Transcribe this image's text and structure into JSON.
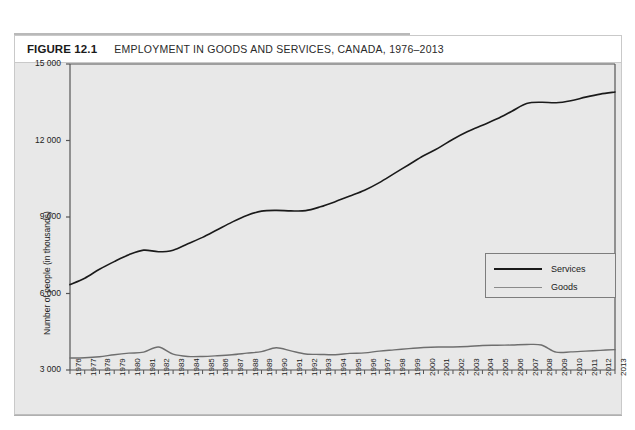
{
  "figure": {
    "number_label": "FIGURE 12.1",
    "title": "EMPLOYMENT IN GOODS AND SERVICES, CANADA, 1976–2013"
  },
  "chart_data": {
    "type": "line",
    "title": "EMPLOYMENT IN GOODS AND SERVICES, CANADA, 1976–2013",
    "xlabel": "Year",
    "ylabel": "Number of people (in thousands)",
    "xlim": [
      1976,
      2013
    ],
    "ylim": [
      3000,
      15000
    ],
    "ytick_labels": [
      "15 000",
      "12 000",
      "9 000",
      "6 000",
      "3 000"
    ],
    "ytick_values": [
      15000,
      12000,
      9000,
      6000,
      3000
    ],
    "grid": false,
    "legend_position": "center-right",
    "categories": [
      1976,
      1977,
      1978,
      1979,
      1980,
      1981,
      1982,
      1983,
      1984,
      1985,
      1986,
      1987,
      1988,
      1989,
      1990,
      1991,
      1992,
      1993,
      1994,
      1995,
      1996,
      1997,
      1998,
      1999,
      2000,
      2001,
      2002,
      2003,
      2004,
      2005,
      2006,
      2007,
      2008,
      2009,
      2010,
      2011,
      2012,
      2013
    ],
    "x_tick_labels": [
      "1976",
      "1977",
      "1978",
      "1979",
      "1980",
      "1981",
      "1982",
      "1983",
      "1984",
      "1985",
      "1986",
      "1987",
      "1988",
      "1989",
      "1990",
      "1991",
      "1992",
      "1993",
      "1994",
      "1995",
      "1996",
      "1997",
      "1998",
      "1999",
      "2000",
      "2001",
      "2002",
      "2003",
      "2004",
      "2005",
      "2006",
      "2007",
      "2008",
      "2009",
      "2010",
      "2011",
      "2012",
      "2013"
    ],
    "series": [
      {
        "name": "Services",
        "color": "#1a1a1a",
        "width": 1.6,
        "values": [
          6350,
          6600,
          6950,
          7250,
          7520,
          7700,
          7640,
          7700,
          7950,
          8200,
          8500,
          8800,
          9060,
          9230,
          9260,
          9240,
          9250,
          9400,
          9600,
          9820,
          10050,
          10350,
          10700,
          11050,
          11400,
          11700,
          12050,
          12350,
          12600,
          12850,
          13150,
          13450,
          13500,
          13480,
          13560,
          13700,
          13820,
          13900
        ]
      },
      {
        "name": "Goods",
        "color": "#6e6e6e",
        "width": 1.4,
        "values": [
          3470,
          3480,
          3520,
          3600,
          3660,
          3700,
          3900,
          3620,
          3530,
          3530,
          3560,
          3600,
          3660,
          3720,
          3870,
          3750,
          3630,
          3610,
          3600,
          3650,
          3670,
          3740,
          3790,
          3840,
          3880,
          3900,
          3900,
          3920,
          3960,
          3970,
          3980,
          4000,
          3980,
          3700,
          3710,
          3740,
          3770,
          3800
        ]
      }
    ]
  },
  "legend": {
    "items": [
      {
        "label": "Services",
        "color": "#1a1a1a"
      },
      {
        "label": "Goods",
        "color": "#8a8a8a"
      }
    ]
  }
}
